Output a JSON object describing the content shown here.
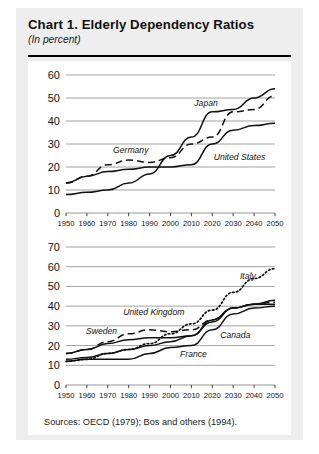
{
  "header": {
    "title": "Chart 1.  Elderly Dependency Ratios",
    "subtitle": "(In percent)"
  },
  "source": {
    "text": "Sources:  OECD (1979); Bos and others (1994)."
  },
  "colors": {
    "page_background": "#ffffff",
    "card_background": "#eeeeee",
    "plot_background": "#ffffff",
    "line": "#111111",
    "gridline": "#8a8a8a",
    "rule": "#000000"
  },
  "chart_data": [
    {
      "type": "line",
      "title": "Chart 1.  Elderly Dependency Ratios",
      "subtitle": "(In percent)",
      "panel": "top",
      "xlabel": "",
      "ylabel": "",
      "xlim": [
        1950,
        2050
      ],
      "ylim": [
        0,
        60
      ],
      "grid": true,
      "legend": "inline-annotations",
      "x": [
        1950,
        1960,
        1970,
        1980,
        1990,
        2000,
        2010,
        2020,
        2030,
        2040,
        2050
      ],
      "xticks": [
        "1950",
        "1960",
        "1970",
        "1980",
        "1990",
        "2000",
        "2010",
        "2020",
        "2030",
        "2040",
        "2050"
      ],
      "yticks": [
        "0",
        "10",
        "20",
        "30",
        "40",
        "50",
        "60"
      ],
      "series": [
        {
          "name": "Japan",
          "style": "solid",
          "values": [
            8,
            9,
            10,
            13,
            17,
            25,
            33,
            44,
            45,
            50,
            54
          ]
        },
        {
          "name": "Germany",
          "style": "dashed",
          "values": [
            13,
            16,
            21,
            23,
            22,
            24,
            30,
            33,
            44,
            45,
            51
          ]
        },
        {
          "name": "United States",
          "style": "solid",
          "values": [
            13,
            16,
            18,
            19,
            20,
            20,
            21,
            30,
            36,
            38,
            39
          ]
        }
      ]
    },
    {
      "type": "line",
      "panel": "bottom",
      "xlabel": "",
      "ylabel": "",
      "xlim": [
        1950,
        2050
      ],
      "ylim": [
        0,
        70
      ],
      "grid": true,
      "legend": "inline-annotations",
      "x": [
        1950,
        1960,
        1970,
        1980,
        1990,
        2000,
        2010,
        2020,
        2030,
        2040,
        2050
      ],
      "xticks": [
        "1950",
        "1960",
        "1970",
        "1980",
        "1990",
        "2000",
        "2010",
        "2020",
        "2030",
        "2040",
        "2050"
      ],
      "yticks": [
        "0",
        "10",
        "20",
        "30",
        "40",
        "50",
        "60",
        "70"
      ],
      "series": [
        {
          "name": "Italy",
          "style": "dotted",
          "values": [
            12,
            13,
            16,
            18,
            21,
            26,
            31,
            38,
            47,
            54,
            59
          ]
        },
        {
          "name": "United Kingdom",
          "style": "dashed",
          "values": [
            16,
            18,
            22,
            26,
            28,
            27,
            28,
            33,
            39,
            41,
            42
          ]
        },
        {
          "name": "Sweden",
          "style": "solid",
          "values": [
            16,
            18,
            21,
            23,
            24,
            24,
            25,
            33,
            39,
            41,
            43
          ]
        },
        {
          "name": "Canada",
          "style": "solid",
          "values": [
            13,
            14,
            16,
            18,
            20,
            22,
            25,
            32,
            39,
            41,
            41
          ]
        },
        {
          "name": "France",
          "style": "solid",
          "values": [
            12,
            13,
            13,
            13,
            16,
            19,
            20,
            28,
            36,
            39,
            40
          ]
        }
      ]
    }
  ]
}
